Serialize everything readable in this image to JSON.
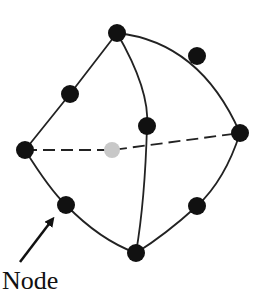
{
  "diagram": {
    "label": "Node",
    "colors": {
      "node": "#111111",
      "hidden_node": "#c8c8c8",
      "edge": "#222222"
    },
    "nodes": [
      {
        "id": "top",
        "x": 117,
        "y": 33,
        "hidden": false
      },
      {
        "id": "upper-right",
        "x": 197,
        "y": 56,
        "hidden": false
      },
      {
        "id": "upper-left",
        "x": 70,
        "y": 94,
        "hidden": false
      },
      {
        "id": "center",
        "x": 147,
        "y": 126,
        "hidden": false
      },
      {
        "id": "right",
        "x": 240,
        "y": 133,
        "hidden": false
      },
      {
        "id": "left",
        "x": 25,
        "y": 150,
        "hidden": false
      },
      {
        "id": "hidden-mid",
        "x": 112,
        "y": 150,
        "hidden": true
      },
      {
        "id": "lower-left",
        "x": 66,
        "y": 205,
        "hidden": false
      },
      {
        "id": "lower-right",
        "x": 197,
        "y": 206,
        "hidden": false
      },
      {
        "id": "bottom",
        "x": 136,
        "y": 253,
        "hidden": false
      }
    ]
  }
}
